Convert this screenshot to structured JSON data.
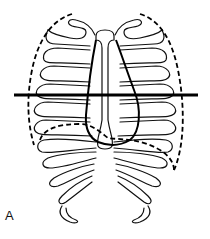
{
  "figure": {
    "label": "A",
    "colors": {
      "stroke": "#111111",
      "background": "#ffffff"
    },
    "elements": [
      {
        "name": "rib-cage",
        "style": "thin solid outlines"
      },
      {
        "name": "sternum",
        "style": "thin solid outline"
      },
      {
        "name": "heart-outline",
        "style": "thick solid"
      },
      {
        "name": "lung-outline",
        "style": "dashed"
      },
      {
        "name": "diaphragm-outline",
        "style": "dashed"
      },
      {
        "name": "horizontal-line",
        "style": "thick solid",
        "y": 95
      }
    ]
  }
}
